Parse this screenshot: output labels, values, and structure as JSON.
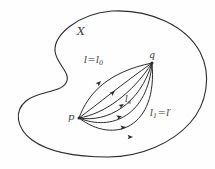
{
  "figure": {
    "type": "topology-homotopy-diagram",
    "space_label": "X",
    "stroke_color": "#2b2b2b",
    "background_color": "#fefefe",
    "points": [
      {
        "name": "p",
        "label": "p",
        "x": 79,
        "y": 118
      },
      {
        "name": "q",
        "label": "q",
        "x": 152,
        "y": 63
      }
    ],
    "labels": {
      "space": "X",
      "point_start": "p",
      "point_end": "q",
      "path_first_main": "l",
      "path_first_eq": "=",
      "path_first_sub_base": "l",
      "path_first_sub": "0",
      "path_middle_base": "l",
      "path_middle_sub": "s",
      "path_last_base": "l",
      "path_last_sub": "1",
      "path_last_eq": "=",
      "path_last_alt": "l",
      "path_last_prime": "′"
    },
    "path_count": 6,
    "arrow_direction": "from p to q"
  }
}
